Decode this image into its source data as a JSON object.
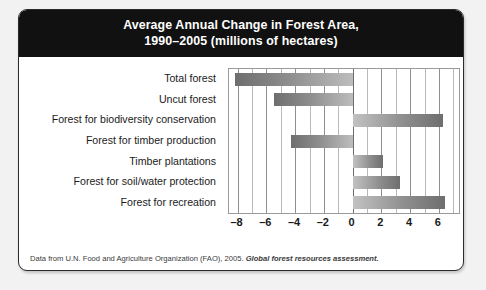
{
  "card": {
    "title_line1": "Average Annual Change in Forest Area,",
    "title_line2": "1990–2005 (millions of hectares)",
    "source_prefix": "Data from U.N. Food and Agriculture Organization (FAO), 2005. ",
    "source_italic": "Global forest resources assessment."
  },
  "colors": {
    "header_bg": "#111111",
    "header_text": "#ffffff",
    "card_bg": "#ffffff",
    "page_bg": "#f2f2f2",
    "bar_dark": "#6e6e6e",
    "bar_light": "#c2c2c2",
    "gridline": "#b9b9b9",
    "axis": "#8e8e8e"
  },
  "chart_data": {
    "type": "bar",
    "orientation": "horizontal",
    "title": "Average Annual Change in Forest Area, 1990–2005 (millions of hectares)",
    "xlabel": "",
    "ylabel": "",
    "xlim": [
      -8.6,
      7.4
    ],
    "grid": true,
    "legend": "none",
    "categories": [
      "Total forest",
      "Uncut forest",
      "Forest for biodiversity conservation",
      "Forest for timber production",
      "Timber plantations",
      "Forest for soil/water protection",
      "Forest for recreation"
    ],
    "values": [
      -8.2,
      -5.5,
      6.3,
      -4.3,
      2.1,
      3.3,
      6.4
    ],
    "xticks": [
      -8,
      -6,
      -4,
      -2,
      0,
      2,
      4,
      6
    ],
    "xtick_labels": [
      "–8",
      "–6",
      "–4",
      "–2",
      "0",
      "2",
      "4",
      "6"
    ],
    "minor_gridlines": [
      -7,
      -5,
      -3,
      -1,
      1,
      3,
      5,
      7
    ]
  }
}
